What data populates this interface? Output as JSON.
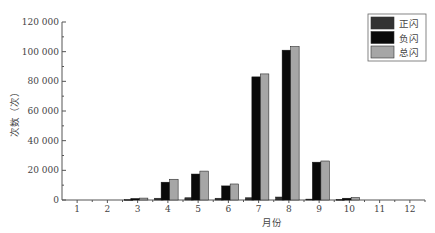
{
  "chart_data": {
    "type": "bar",
    "title": "",
    "xlabel": "月份",
    "ylabel": "次数（次）",
    "ylim": [
      0,
      120000
    ],
    "yticks": [
      0,
      20000,
      40000,
      60000,
      80000,
      100000,
      120000
    ],
    "ytick_labels": [
      "0",
      "20 000",
      "40 000",
      "60 000",
      "80 000",
      "100 000",
      "120 000"
    ],
    "categories": [
      "1",
      "2",
      "3",
      "4",
      "5",
      "6",
      "7",
      "8",
      "9",
      "10",
      "11",
      "12"
    ],
    "series": [
      {
        "name": "正闪",
        "color": "#333333",
        "values": [
          0,
          0,
          300,
          1200,
          1500,
          1200,
          1500,
          2000,
          600,
          400,
          0,
          0
        ]
      },
      {
        "name": "负闪",
        "color": "#0a0a0a",
        "values": [
          0,
          0,
          1000,
          12000,
          17500,
          9500,
          83000,
          101000,
          25500,
          1200,
          0,
          0
        ]
      },
      {
        "name": "总闪",
        "color": "#a6a6a6",
        "values": [
          0,
          0,
          1300,
          14000,
          19500,
          10800,
          85000,
          103500,
          26300,
          1700,
          0,
          0
        ]
      }
    ],
    "legend_position": "top-right",
    "grid": false
  }
}
